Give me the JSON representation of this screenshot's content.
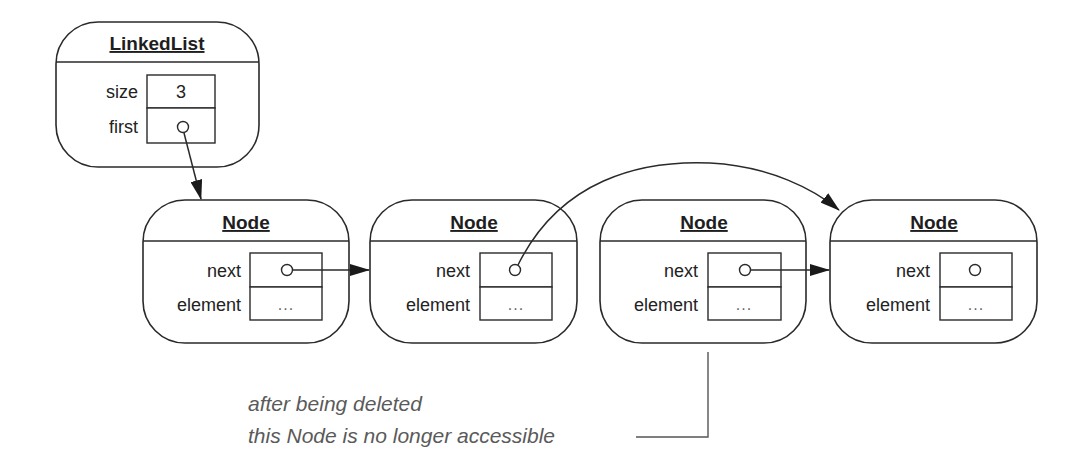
{
  "diagram": {
    "type": "linked-list-object-diagram",
    "colors": {
      "stroke": "#2a2a2a",
      "annotation": "#5a5a5a",
      "background": "#ffffff"
    },
    "linked_list": {
      "title": "LinkedList",
      "fields": [
        {
          "name": "size",
          "value": "3"
        },
        {
          "name": "first",
          "value": "pointer"
        }
      ]
    },
    "nodes": [
      {
        "title": "Node",
        "fields": [
          {
            "name": "next",
            "value": "pointer"
          },
          {
            "name": "element",
            "value": "..."
          }
        ]
      },
      {
        "title": "Node",
        "fields": [
          {
            "name": "next",
            "value": "pointer"
          },
          {
            "name": "element",
            "value": "..."
          }
        ]
      },
      {
        "title": "Node",
        "fields": [
          {
            "name": "next",
            "value": "pointer"
          },
          {
            "name": "element",
            "value": "..."
          }
        ]
      },
      {
        "title": "Node",
        "fields": [
          {
            "name": "next",
            "value": "pointer"
          },
          {
            "name": "element",
            "value": "..."
          }
        ]
      }
    ],
    "edges": [
      {
        "from": "LinkedList.first",
        "to": "Node 1"
      },
      {
        "from": "Node 1.next",
        "to": "Node 2"
      },
      {
        "from": "Node 2.next",
        "to": "Node 4",
        "style": "curved-over"
      },
      {
        "from": "Node 3.next",
        "to": "Node 4"
      }
    ],
    "annotation": {
      "line1": "after being deleted",
      "line2": "this Node is no longer accessible",
      "target": "Node 3"
    }
  }
}
